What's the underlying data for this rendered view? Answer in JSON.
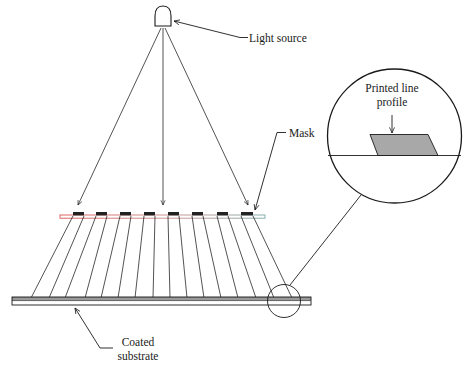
{
  "diagram": {
    "type": "photolithography-contact-printing",
    "labels": {
      "light_source": "Light source",
      "mask": "Mask",
      "coated_substrate_line1": "Coated",
      "coated_substrate_line2": "substrate",
      "profile_line1": "Printed line",
      "profile_line2": "profile"
    },
    "components": {
      "light_source_icon": "lamp-dome-icon",
      "mask_block_count": 8,
      "transmitted_ray_count": 16,
      "incident_ray_count": 3,
      "magnifier": "detail-circle"
    },
    "colors": {
      "line": "#1a1a1a",
      "coating": "#9a9a9a",
      "mask_blocks": "#222222",
      "mask_left_tint": "#d9534f",
      "mask_right_tint": "#7aa8a8",
      "profile_fill": "#a8a8a8",
      "background": "#ffffff"
    }
  }
}
